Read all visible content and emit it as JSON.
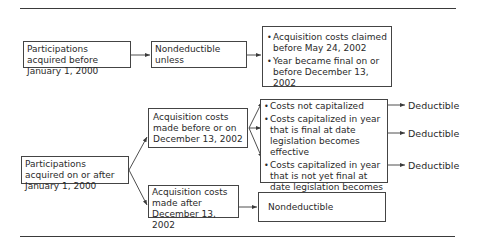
{
  "diagram": {
    "type": "flowchart",
    "nodes": {
      "pre2000": {
        "text": "Participations acquired before January 1, 2000"
      },
      "nondeductible_unless": {
        "text": "Nondeductible unless"
      },
      "exceptions": {
        "items": [
          "Acquisition costs claimed before May 24, 2002",
          "Year became final on or before December 13, 2002"
        ]
      },
      "post2000": {
        "text": "Participations acquired on or after January 1, 2000"
      },
      "costs_before": {
        "text": "Acquisition costs made before or on December 13, 2002"
      },
      "capitalization": {
        "items": [
          "Costs not capitalized",
          "Costs capitalized in year that is final at date legislation becomes effective",
          "Costs capitalized in year that is not yet final at date legislation becomes effective"
        ]
      },
      "costs_after": {
        "text": "Acquisition costs made after December 13, 2002"
      },
      "nondeductible": {
        "text": "Nondeductible"
      }
    },
    "outcomes": [
      "Deductible",
      "Deductible",
      "Deductible"
    ],
    "edges": [
      [
        "pre2000",
        "nondeductible_unless"
      ],
      [
        "nondeductible_unless",
        "exceptions"
      ],
      [
        "post2000",
        "costs_before"
      ],
      [
        "post2000",
        "costs_after"
      ],
      [
        "costs_before",
        "capitalization.0"
      ],
      [
        "costs_before",
        "capitalization.1"
      ],
      [
        "costs_before",
        "capitalization.2"
      ],
      [
        "capitalization.0",
        "outcomes.0"
      ],
      [
        "capitalization.1",
        "outcomes.1"
      ],
      [
        "capitalization.2",
        "outcomes.2"
      ],
      [
        "costs_after",
        "nondeductible"
      ]
    ],
    "colors": {
      "line": "#3a3a3a",
      "text": "#2a2a2a",
      "background": "#ffffff"
    }
  }
}
